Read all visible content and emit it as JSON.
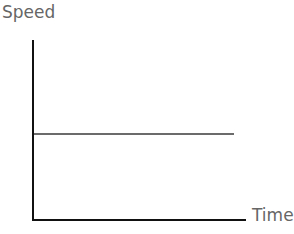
{
  "chart_data": {
    "type": "line",
    "title": "",
    "xlabel": "Time",
    "ylabel": "Speed",
    "grid": false,
    "legend": null,
    "x_ticks": [],
    "y_ticks": [],
    "series": [
      {
        "name": "speed",
        "description": "constant speed over time (horizontal line)",
        "color": "#6b6b6b",
        "points": [
          [
            0,
            0.48
          ],
          [
            0.94,
            0.48
          ]
        ]
      }
    ],
    "xlim": [
      0,
      1
    ],
    "ylim": [
      0,
      1
    ]
  },
  "labels": {
    "y_axis": "Speed",
    "x_axis": "Time"
  },
  "colors": {
    "axis": "#111111",
    "line": "#6b6b6b",
    "label": "#666666"
  }
}
